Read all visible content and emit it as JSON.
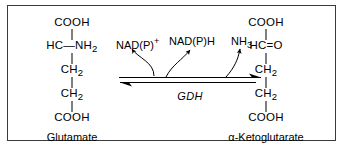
{
  "figure": {
    "border_color": "#3a3a3a",
    "background": "#ffffff",
    "text_color": "#000000"
  },
  "reactant": {
    "name": "Glutamate",
    "rows": [
      {
        "text": "COOH"
      },
      {
        "text": "HC—NH2",
        "html": "HC—NH<sub>2</sub>"
      },
      {
        "text": "CH2",
        "html": "CH<sub>2</sub>"
      },
      {
        "text": "CH2",
        "html": "CH<sub>2</sub>"
      },
      {
        "text": "COOH"
      }
    ]
  },
  "product": {
    "name": "α-Ketoglutarate",
    "rows": [
      {
        "text": "COOH"
      },
      {
        "text": "HC=O",
        "html": "HC=O"
      },
      {
        "text": "CH2",
        "html": "CH<sub>2</sub>"
      },
      {
        "text": "CH2",
        "html": "CH<sub>2</sub>"
      },
      {
        "text": "COOH"
      }
    ]
  },
  "reaction": {
    "enzyme": "GDH",
    "cofactors": [
      {
        "id": "nadp-plus",
        "text": "NAD(P)+",
        "html": "NAD(P)<sup>+</sup>"
      },
      {
        "id": "nadph",
        "text": "NAD(P)H",
        "html": "NAD(P)H"
      },
      {
        "id": "nh3",
        "text": "NH3",
        "html": "NH<sub>3</sub>"
      }
    ],
    "forward_direction": "right",
    "reverse_direction": "left",
    "reversible": true
  }
}
